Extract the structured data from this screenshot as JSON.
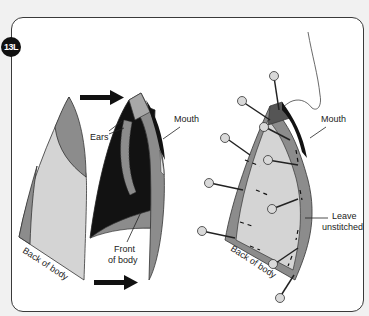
{
  "step": {
    "badge": "13L"
  },
  "left_diagram": {
    "labels": {
      "ears": "Ears",
      "mouth": "Mouth",
      "front_line1": "Front",
      "front_line2": "of body",
      "back": "Back of body"
    },
    "arrows": [
      "top-arrow-right",
      "bottom-arrow-right"
    ]
  },
  "right_diagram": {
    "labels": {
      "mouth": "Mouth",
      "leave_line1": "Leave",
      "leave_line2": "unstitched",
      "back": "Back of body"
    },
    "pin_count": 10
  },
  "colors": {
    "light_fabric": "#d4d4d4",
    "mid_fabric": "#8c8c8c",
    "dark_fabric": "#121212",
    "pin_head": "#d9d9d9",
    "badge": "#111111"
  }
}
